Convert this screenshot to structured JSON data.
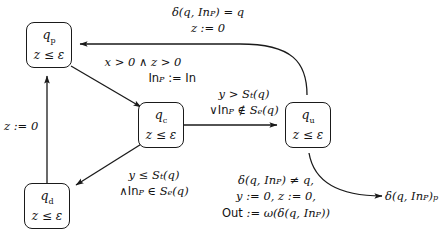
{
  "diagram": {
    "stroke_color": "#1a1a1a",
    "background": "#ffffff",
    "nodes": [
      {
        "id": "qp",
        "name": "q",
        "sub": "p",
        "invariant": "z ≤ ε"
      },
      {
        "id": "qc",
        "name": "q",
        "sub": "c",
        "invariant": "z ≤ ε"
      },
      {
        "id": "qu",
        "name": "q",
        "sub": "u",
        "invariant": "z ≤ ε"
      },
      {
        "id": "qd",
        "name": "q",
        "sub": "d",
        "invariant": "z ≤ ε"
      }
    ],
    "labels": {
      "qu_to_qp_line1": "δ(q, In",
      "qu_to_qp_line1_sub": "P",
      "qu_to_qp_line1_tail": ") = q",
      "qu_to_qp_line2": "z := 0",
      "qp_to_qc_line1": "x > 0 ∧ z > 0",
      "qp_to_qc_line2": "In",
      "qp_to_qc_line2_sub": "P",
      "qp_to_qc_line2_tail": " := In",
      "qc_to_qu_line1": "y > S",
      "qc_to_qu_line1_sub": "t",
      "qc_to_qu_line1_tail": "(q)",
      "qc_to_qu_line2": "∨In",
      "qc_to_qu_line2_sub": "P",
      "qc_to_qu_line2_tail": " ∉ S",
      "qc_to_qu_line2_sub2": "e",
      "qc_to_qu_line2_tail2": "(q)",
      "qc_to_qd_line1": "y ≤ S",
      "qc_to_qd_line1_sub": "t",
      "qc_to_qd_line1_tail": "(q)",
      "qc_to_qd_line2": "∧In",
      "qc_to_qd_line2_sub": "P",
      "qc_to_qd_line2_tail": " ∈ S",
      "qc_to_qd_line2_sub2": "e",
      "qc_to_qd_line2_tail2": "(q)",
      "qd_to_qp": "z := 0",
      "qu_out_line1": "δ(q, In",
      "qu_out_line1_sub": "P",
      "qu_out_line1_tail": ") ≠ q,",
      "qu_out_line2": "y := 0, z := 0,",
      "qu_out_line3_head": "Out",
      "qu_out_line3_mid": " := ω(δ(q, In",
      "qu_out_line3_sub": "P",
      "qu_out_line3_tail": "))",
      "exit_target": "δ(q, In",
      "exit_target_sub": "P",
      "exit_target_tail": ")",
      "exit_target_sub2": "p"
    }
  }
}
